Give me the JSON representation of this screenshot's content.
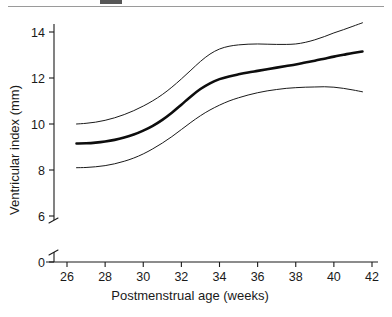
{
  "figure": {
    "top_rule": "horizontal-rule",
    "caption_remnant": "cropped-caption-text"
  },
  "chart_data": {
    "type": "line",
    "title": "",
    "subtitle": "",
    "xlabel": "Postmenstrual age (weeks)",
    "ylabel": "Ventricular index (mm)",
    "xlim": [
      25.0,
      42.0
    ],
    "ylim_display": [
      0,
      15.0
    ],
    "y_axis_break": {
      "present": true,
      "between": [
        0,
        6
      ]
    },
    "grid": false,
    "legend": {
      "present": false,
      "position": "none"
    },
    "xticks": [
      26,
      28,
      30,
      32,
      34,
      36,
      38,
      40,
      42
    ],
    "xtick_labels": [
      "26",
      "28",
      "30",
      "32",
      "34",
      "36",
      "38",
      "40",
      "42"
    ],
    "yticks": [
      0,
      6,
      8,
      10,
      12,
      14
    ],
    "ytick_labels": [
      "0",
      "6",
      "8",
      "10",
      "12",
      "14"
    ],
    "x": [
      26.5,
      27.0,
      27.5,
      28.0,
      28.5,
      29.0,
      29.5,
      30.0,
      30.5,
      31.0,
      31.5,
      32.0,
      32.5,
      33.0,
      33.5,
      34.0,
      34.5,
      35.0,
      35.5,
      36.0,
      36.5,
      37.0,
      37.5,
      38.0,
      38.5,
      39.0,
      39.5,
      40.0,
      40.5,
      41.0,
      41.5
    ],
    "series": [
      {
        "name": "upper percentile",
        "style": "thin",
        "values": [
          10.0,
          10.03,
          10.08,
          10.16,
          10.27,
          10.41,
          10.58,
          10.78,
          11.01,
          11.28,
          11.6,
          11.96,
          12.34,
          12.72,
          13.04,
          13.26,
          13.38,
          13.44,
          13.47,
          13.48,
          13.47,
          13.46,
          13.46,
          13.48,
          13.55,
          13.66,
          13.8,
          13.96,
          14.1,
          14.25,
          14.4
        ]
      },
      {
        "name": "median",
        "style": "thick",
        "values": [
          9.15,
          9.16,
          9.19,
          9.24,
          9.31,
          9.41,
          9.54,
          9.71,
          9.92,
          10.18,
          10.49,
          10.84,
          11.2,
          11.52,
          11.77,
          11.95,
          12.07,
          12.16,
          12.24,
          12.31,
          12.38,
          12.45,
          12.52,
          12.59,
          12.67,
          12.75,
          12.84,
          12.93,
          13.01,
          13.09,
          13.15
        ]
      },
      {
        "name": "lower percentile",
        "style": "thin",
        "values": [
          8.1,
          8.11,
          8.14,
          8.19,
          8.27,
          8.38,
          8.52,
          8.7,
          8.92,
          9.17,
          9.45,
          9.76,
          10.07,
          10.36,
          10.61,
          10.82,
          11.0,
          11.14,
          11.26,
          11.36,
          11.44,
          11.5,
          11.55,
          11.58,
          11.6,
          11.61,
          11.62,
          11.6,
          11.55,
          11.48,
          11.4
        ]
      }
    ]
  }
}
